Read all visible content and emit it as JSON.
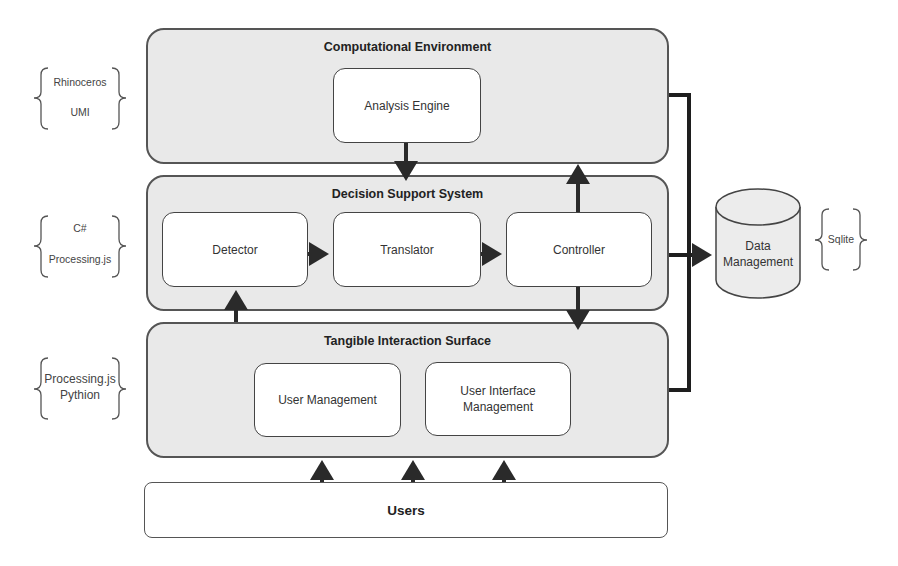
{
  "panels": {
    "computational_environment": {
      "title": "Computational Environment",
      "components": [
        "Analysis Engine"
      ]
    },
    "decision_support_system": {
      "title": "Decision Support System",
      "components": [
        "Detector",
        "Translator",
        "Controller"
      ]
    },
    "tangible_interaction_surface": {
      "title": "Tangible Interaction Surface",
      "components": [
        "User Management",
        "User Interface Management"
      ]
    }
  },
  "users": {
    "label": "Users"
  },
  "data_store": {
    "label_line1": "Data",
    "label_line2": "Management"
  },
  "technologies": {
    "computational_environment": [
      "Rhinoceros",
      "UMI"
    ],
    "decision_support_system": [
      "C#",
      "Processing.js"
    ],
    "tangible_interaction_surface": [
      "Processing.js",
      "Pythion"
    ],
    "data_store": [
      "Sqlite"
    ]
  },
  "colors": {
    "panel_fill": "#e9e9e9",
    "box_fill": "#ffffff",
    "stroke": "#444444",
    "arrow": "#2a2a2a"
  }
}
